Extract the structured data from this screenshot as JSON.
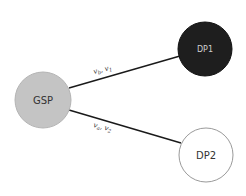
{
  "diagram": {
    "nodes": [
      {
        "id": "gsp",
        "label": "GSP",
        "fill": "#c4c4c4",
        "stroke": "#b0b0b0",
        "text_color": "#333333"
      },
      {
        "id": "dp1",
        "label": "DP1",
        "fill": "#1e1e1e",
        "stroke": "#111111",
        "text_color": "#cfcfcf"
      },
      {
        "id": "dp2",
        "label": "DP2",
        "fill": "#ffffff",
        "stroke": "#9a9a9a",
        "text_color": "#333333"
      }
    ],
    "edges": [
      {
        "from": "gsp",
        "to": "dp1",
        "label_main": "v",
        "sub1": "b",
        "sep": ", ",
        "label_main2": "v",
        "sub2": "1"
      },
      {
        "from": "gsp",
        "to": "dp2",
        "label_main": "v",
        "sub1": "a",
        "sep": ", ",
        "label_main2": "v",
        "sub2": "2"
      }
    ]
  }
}
